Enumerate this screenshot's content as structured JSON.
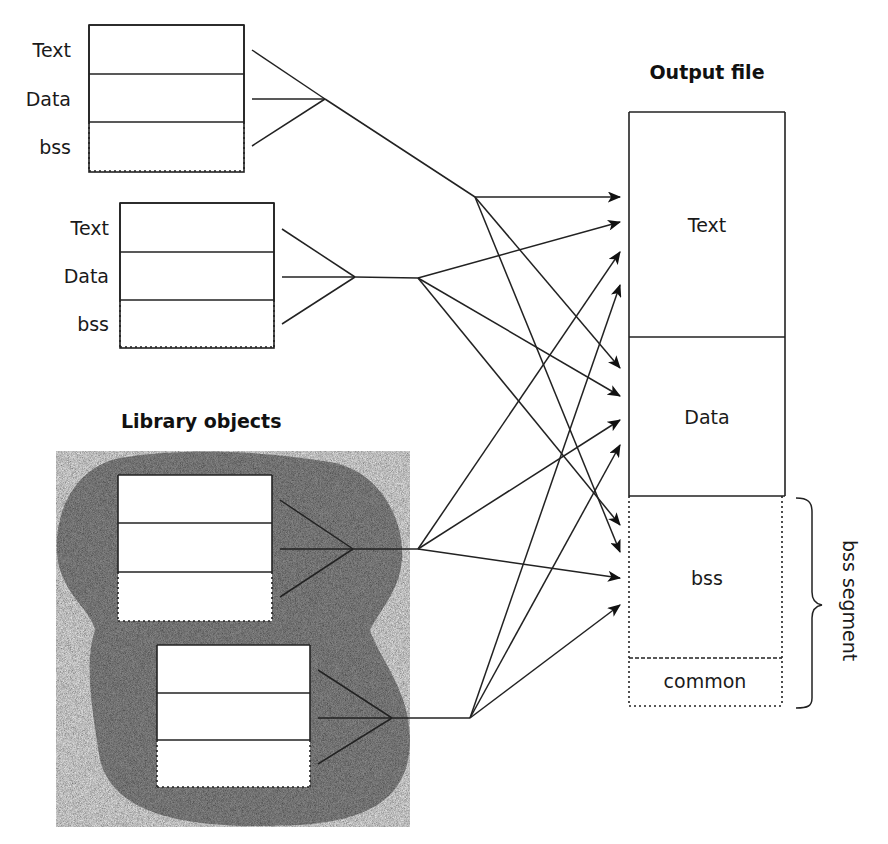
{
  "diagram": {
    "title_output": "Output file",
    "title_library": "Library objects",
    "object1": {
      "labels": [
        "Text",
        "Data",
        "bss"
      ]
    },
    "object2": {
      "labels": [
        "Text",
        "Data",
        "bss"
      ]
    },
    "library_object1": {
      "sections": 3
    },
    "library_object2": {
      "sections": 3
    },
    "output": {
      "sections": [
        "Text",
        "Data",
        "bss",
        "common"
      ]
    },
    "brace_label": "bss segment"
  },
  "colors": {
    "line": "#222222",
    "library_fill": "#9a9a9a",
    "background": "#ffffff"
  }
}
